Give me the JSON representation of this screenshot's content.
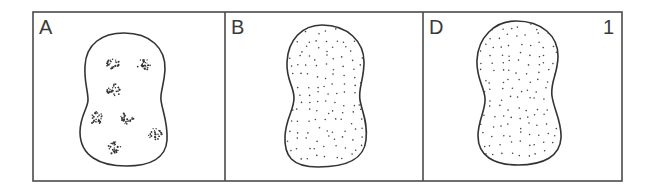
{
  "figure": {
    "number": "1",
    "frame_color": "#4a4a4a",
    "ink_color": "#333333",
    "panels": [
      {
        "label": "A",
        "pattern": "clustered",
        "cluster_count": 7,
        "clusters": [
          {
            "x": 112,
            "y": 63
          },
          {
            "x": 144,
            "y": 65
          },
          {
            "x": 114,
            "y": 90
          },
          {
            "x": 96,
            "y": 118
          },
          {
            "x": 127,
            "y": 119
          },
          {
            "x": 155,
            "y": 134
          },
          {
            "x": 114,
            "y": 148
          }
        ]
      },
      {
        "label": "B",
        "pattern": "uniform-stipple"
      },
      {
        "label": "D",
        "pattern": "uniform-stipple"
      }
    ]
  }
}
